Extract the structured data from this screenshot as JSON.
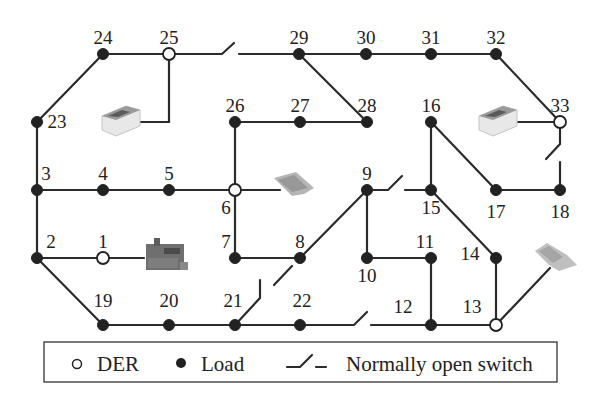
{
  "diagram": {
    "nodes": [
      {
        "id": "1",
        "type": "der",
        "x": 103,
        "y": 258,
        "label_dx": 0,
        "label_dy": -10,
        "anchor": "middle"
      },
      {
        "id": "2",
        "type": "load",
        "x": 37,
        "y": 258,
        "label_dx": 14,
        "label_dy": -10,
        "anchor": "middle"
      },
      {
        "id": "3",
        "type": "load",
        "x": 37,
        "y": 190,
        "label_dx": 9,
        "label_dy": -10,
        "anchor": "middle"
      },
      {
        "id": "4",
        "type": "load",
        "x": 103,
        "y": 190,
        "label_dx": 0,
        "label_dy": -10,
        "anchor": "middle"
      },
      {
        "id": "5",
        "type": "load",
        "x": 169,
        "y": 190,
        "label_dx": 0,
        "label_dy": -10,
        "anchor": "middle"
      },
      {
        "id": "6",
        "type": "der",
        "x": 235,
        "y": 190,
        "label_dx": -9,
        "label_dy": 24,
        "anchor": "middle"
      },
      {
        "id": "7",
        "type": "load",
        "x": 235,
        "y": 258,
        "label_dx": -9,
        "label_dy": -10,
        "anchor": "middle"
      },
      {
        "id": "8",
        "type": "load",
        "x": 300,
        "y": 258,
        "label_dx": 0,
        "label_dy": -10,
        "anchor": "middle"
      },
      {
        "id": "9",
        "type": "load",
        "x": 367,
        "y": 190,
        "label_dx": 0,
        "label_dy": -10,
        "anchor": "middle"
      },
      {
        "id": "10",
        "type": "load",
        "x": 367,
        "y": 258,
        "label_dx": 0,
        "label_dy": 24,
        "anchor": "middle"
      },
      {
        "id": "11",
        "type": "load",
        "x": 431,
        "y": 258,
        "label_dx": -6,
        "label_dy": -10,
        "anchor": "middle"
      },
      {
        "id": "12",
        "type": "load",
        "x": 431,
        "y": 325,
        "label_dx": -28,
        "label_dy": -12,
        "anchor": "middle"
      },
      {
        "id": "13",
        "type": "der",
        "x": 496,
        "y": 325,
        "label_dx": -24,
        "label_dy": -12,
        "anchor": "middle"
      },
      {
        "id": "14",
        "type": "load",
        "x": 496,
        "y": 258,
        "label_dx": -26,
        "label_dy": 2,
        "anchor": "middle"
      },
      {
        "id": "15",
        "type": "load",
        "x": 431,
        "y": 190,
        "label_dx": 0,
        "label_dy": 24,
        "anchor": "middle"
      },
      {
        "id": "16",
        "type": "load",
        "x": 431,
        "y": 122,
        "label_dx": 0,
        "label_dy": -10,
        "anchor": "middle"
      },
      {
        "id": "17",
        "type": "load",
        "x": 496,
        "y": 190,
        "label_dx": 0,
        "label_dy": 28,
        "anchor": "middle"
      },
      {
        "id": "18",
        "type": "load",
        "x": 560,
        "y": 190,
        "label_dx": 0,
        "label_dy": 28,
        "anchor": "middle"
      },
      {
        "id": "19",
        "type": "load",
        "x": 103,
        "y": 325,
        "label_dx": 0,
        "label_dy": -18,
        "anchor": "middle"
      },
      {
        "id": "20",
        "type": "load",
        "x": 169,
        "y": 325,
        "label_dx": 0,
        "label_dy": -18,
        "anchor": "middle"
      },
      {
        "id": "21",
        "type": "load",
        "x": 235,
        "y": 325,
        "label_dx": -2,
        "label_dy": -18,
        "anchor": "middle"
      },
      {
        "id": "22",
        "type": "load",
        "x": 300,
        "y": 325,
        "label_dx": 2,
        "label_dy": -18,
        "anchor": "middle"
      },
      {
        "id": "23",
        "type": "load",
        "x": 37,
        "y": 122,
        "label_dx": 20,
        "label_dy": 6,
        "anchor": "middle"
      },
      {
        "id": "24",
        "type": "load",
        "x": 103,
        "y": 54,
        "label_dx": 0,
        "label_dy": -10,
        "anchor": "middle"
      },
      {
        "id": "25",
        "type": "der",
        "x": 169,
        "y": 54,
        "label_dx": 0,
        "label_dy": -10,
        "anchor": "middle"
      },
      {
        "id": "26",
        "type": "load",
        "x": 235,
        "y": 122,
        "label_dx": 0,
        "label_dy": -10,
        "anchor": "middle"
      },
      {
        "id": "27",
        "type": "load",
        "x": 300,
        "y": 122,
        "label_dx": 0,
        "label_dy": -10,
        "anchor": "middle"
      },
      {
        "id": "28",
        "type": "load",
        "x": 367,
        "y": 122,
        "label_dx": 0,
        "label_dy": -10,
        "anchor": "middle"
      },
      {
        "id": "29",
        "type": "load",
        "x": 299,
        "y": 54,
        "label_dx": 0,
        "label_dy": -10,
        "anchor": "middle"
      },
      {
        "id": "30",
        "type": "load",
        "x": 366,
        "y": 54,
        "label_dx": 0,
        "label_dy": -10,
        "anchor": "middle"
      },
      {
        "id": "31",
        "type": "load",
        "x": 431,
        "y": 54,
        "label_dx": 0,
        "label_dy": -10,
        "anchor": "middle"
      },
      {
        "id": "32",
        "type": "load",
        "x": 496,
        "y": 54,
        "label_dx": 0,
        "label_dy": -10,
        "anchor": "middle"
      },
      {
        "id": "33",
        "type": "der",
        "x": 560,
        "y": 122,
        "label_dx": 0,
        "label_dy": -10,
        "anchor": "middle"
      }
    ],
    "edges": [
      [
        "24",
        "25"
      ],
      [
        "24",
        "23"
      ],
      [
        "23",
        "3"
      ],
      [
        "3",
        "2"
      ],
      [
        "3",
        "4"
      ],
      [
        "4",
        "5"
      ],
      [
        "5",
        "6"
      ],
      [
        "2",
        "1"
      ],
      [
        "2",
        "19"
      ],
      [
        "19",
        "20"
      ],
      [
        "20",
        "21"
      ],
      [
        "21",
        "22"
      ],
      [
        "6",
        "26"
      ],
      [
        "26",
        "27"
      ],
      [
        "27",
        "28"
      ],
      [
        "6",
        "7"
      ],
      [
        "7",
        "8"
      ],
      [
        "29",
        "30"
      ],
      [
        "30",
        "31"
      ],
      [
        "31",
        "32"
      ],
      [
        "32",
        "33"
      ],
      [
        "29",
        "28"
      ],
      [
        "9",
        "10"
      ],
      [
        "10",
        "11"
      ],
      [
        "11",
        "12"
      ],
      [
        "12",
        "13"
      ],
      [
        "13",
        "14"
      ],
      [
        "14",
        "15"
      ],
      [
        "15",
        "16"
      ],
      [
        "16",
        "17"
      ],
      [
        "17",
        "18"
      ]
    ],
    "open_switches": [
      {
        "between": "25-29",
        "path": "M169,54 L222,54 L234,43 M239,54 L299,54"
      },
      {
        "between": "33-18",
        "path": "M560,122 L560,144 L546,159 M560,162 L560,190"
      },
      {
        "between": "9-15",
        "path": "M367,190 L388,190 L402,176 M405,190 L431,190"
      },
      {
        "between": "8-9",
        "path": "M300,258 L367,190 M274,285 L292,266"
      },
      {
        "between": "21-8",
        "path": "M235,325 L260,298 L260,280"
      },
      {
        "between": "22-12",
        "path": "M300,325 L354,325 L367,312 M371,325 L431,325"
      }
    ],
    "der_attachments": [
      {
        "node": "25",
        "kind": "battery",
        "path": "M169,54 L169,122 L138,122",
        "icon_x": 100,
        "icon_y": 102
      },
      {
        "node": "6",
        "kind": "solar-pv",
        "path": "M235,190 L280,190",
        "icon_x": 272,
        "icon_y": 172
      },
      {
        "node": "1",
        "kind": "generator",
        "path": "M103,258 L144,258",
        "icon_x": 144,
        "icon_y": 238
      },
      {
        "node": "33",
        "kind": "battery",
        "path": "M560,122 L517,122",
        "icon_x": 477,
        "icon_y": 102
      },
      {
        "node": "13",
        "kind": "wind-solar",
        "path": "M496,325 L550,268",
        "icon_x": 533,
        "icon_y": 245
      }
    ]
  },
  "legend": {
    "der_label": "DER",
    "load_label": "Load",
    "switch_label": "Normally open switch"
  }
}
